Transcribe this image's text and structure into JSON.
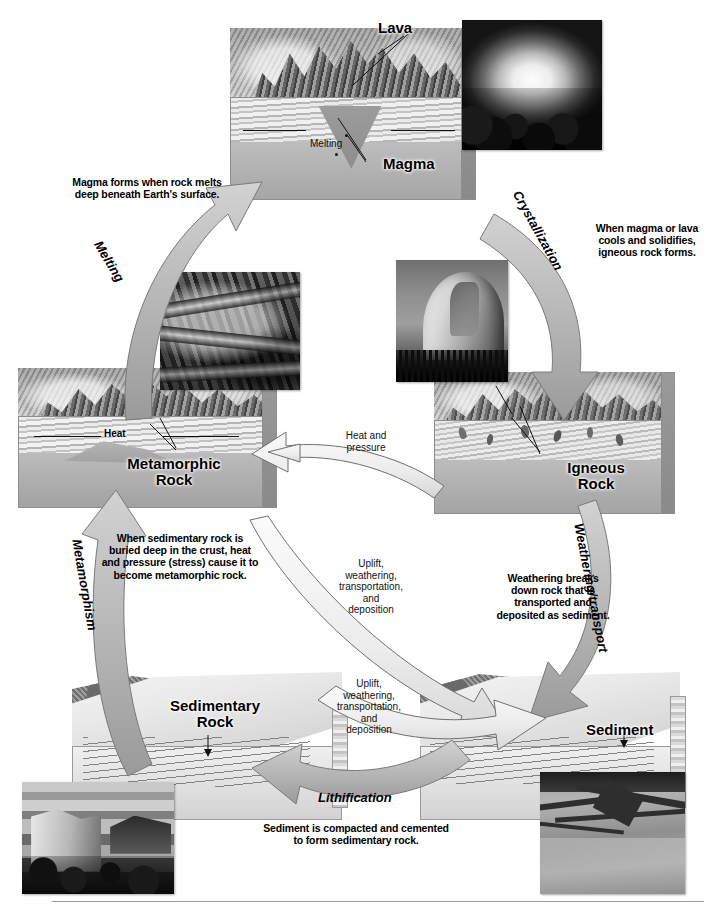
{
  "figure": {
    "type": "cycle-diagram"
  },
  "nodes": {
    "magma": {
      "label": "Magma",
      "lava_label": "Lava",
      "melting_label": "Melting"
    },
    "igneous": {
      "label": "Igneous\nRock",
      "label_line1": "Igneous",
      "label_line2": "Rock"
    },
    "sediment": {
      "label": "Sediment"
    },
    "sedimentary": {
      "label_line1": "Sedimentary",
      "label_line2": "Rock"
    },
    "metamorphic": {
      "label_line1": "Metamorphic",
      "label_line2": "Rock",
      "heat_label": "Heat"
    }
  },
  "processes": {
    "melting": {
      "name": "Melting",
      "description": "Magma forms when rock melts deep beneath Earth's surface."
    },
    "crystallization": {
      "name": "Crystallization",
      "description": "When magma or lava cools and solidifies, igneous rock forms."
    },
    "weathering_transport": {
      "name": "Weathering/transport",
      "description": "Weathering breaks down rock that is transported and deposited as sediment."
    },
    "lithification": {
      "name": "Lithification",
      "description": "Sediment is compacted and cemented to form sedimentary rock."
    },
    "metamorphism": {
      "name": "Metamorphism",
      "description": "When sedimentary rock is buried deep in the crust, heat and pressure (stress) cause it to become metamorphic rock."
    },
    "heat_pressure": {
      "name": "Heat and pressure"
    },
    "uplift_upper": {
      "name": "Uplift,\nweathering,\ntransportation,\nand\ndeposition"
    },
    "uplift_lower": {
      "name": "Uplift,\nweathering,\ntransportation,\nand\ndeposition"
    }
  },
  "labels": {
    "heat_and_pressure_l1": "Heat and",
    "heat_and_pressure_l2": "pressure",
    "uplift_l1": "Uplift,",
    "uplift_l2": "weathering,",
    "uplift_l3": "transportation,",
    "uplift_l4": "and",
    "uplift_l5": "deposition"
  },
  "photos": [
    {
      "name": "lava-eruption-photo",
      "subject": "Erupting lava fountain"
    },
    {
      "name": "folded-metamorphic-rock-photo",
      "subject": "Folded metamorphic rock outcrop"
    },
    {
      "name": "granite-dome-photo",
      "subject": "Granite dome (igneous intrusion)"
    },
    {
      "name": "layered-canyon-photo",
      "subject": "Layered sedimentary canyon walls"
    },
    {
      "name": "braided-river-photo",
      "subject": "Braided river carrying sediment"
    }
  ],
  "colors": {
    "arrow_fill": "#b9b9b9",
    "arrow_light": "#eeeeee",
    "arrow_stroke": "#6b6b6b",
    "text": "#000000",
    "background": "#ffffff",
    "rule": "#9a9a9a"
  }
}
